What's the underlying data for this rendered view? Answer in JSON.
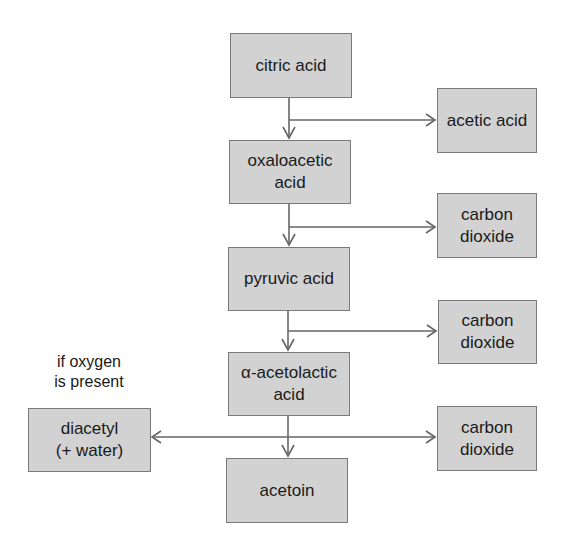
{
  "diagram": {
    "type": "flowchart",
    "nodes": {
      "citric_acid": {
        "lines": [
          "citric acid"
        ]
      },
      "oxaloacetic_acid": {
        "lines": [
          "oxaloacetic",
          "acid"
        ]
      },
      "pyruvic_acid": {
        "lines": [
          "pyruvic acid"
        ]
      },
      "acetolactic_acid": {
        "lines": [
          "α-acetolactic",
          "acid"
        ]
      },
      "acetoin": {
        "lines": [
          "acetoin"
        ]
      },
      "acetic_acid": {
        "lines": [
          "acetic acid"
        ]
      },
      "carbon_dioxide_1": {
        "lines": [
          "carbon",
          "dioxide"
        ]
      },
      "carbon_dioxide_2": {
        "lines": [
          "carbon",
          "dioxide"
        ]
      },
      "carbon_dioxide_3": {
        "lines": [
          "carbon",
          "dioxide"
        ]
      },
      "diacetyl": {
        "lines": [
          "diacetyl",
          "(+ water)"
        ]
      }
    },
    "note": {
      "lines": [
        "if oxygen",
        "is present"
      ]
    },
    "edges": [
      {
        "from": "citric acid",
        "to": "oxaloacetic acid"
      },
      {
        "from": "citric acid",
        "to": "acetic acid"
      },
      {
        "from": "oxaloacetic acid",
        "to": "pyruvic acid"
      },
      {
        "from": "oxaloacetic acid",
        "to": "carbon dioxide"
      },
      {
        "from": "pyruvic acid",
        "to": "α-acetolactic acid"
      },
      {
        "from": "pyruvic acid",
        "to": "carbon dioxide"
      },
      {
        "from": "α-acetolactic acid",
        "to": "acetoin"
      },
      {
        "from": "α-acetolactic acid",
        "to": "carbon dioxide"
      },
      {
        "from": "α-acetolactic acid",
        "to": "diacetyl (+ water)",
        "condition": "if oxygen is present"
      }
    ]
  }
}
